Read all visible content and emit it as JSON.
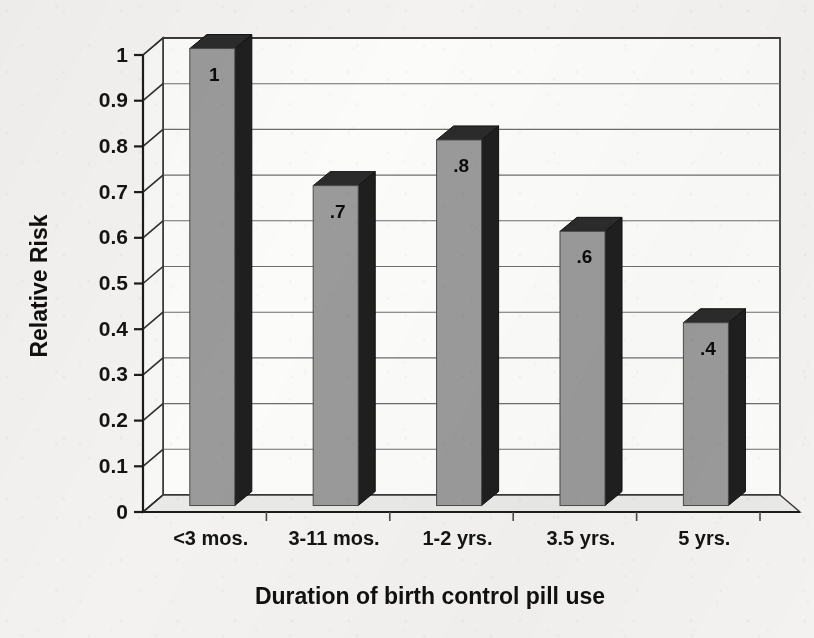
{
  "chart_data": {
    "type": "bar",
    "title": "",
    "xlabel": "Duration of birth control pill use",
    "ylabel": "Relative Risk",
    "categories": [
      "<3 mos.",
      "3-11 mos.",
      "1-2 yrs.",
      "3.5 yrs.",
      "5 yrs."
    ],
    "values": [
      1,
      0.7,
      0.8,
      0.6,
      0.4
    ],
    "data_labels": [
      "1",
      ".7",
      ".8",
      ".6",
      ".4"
    ],
    "ylim": [
      0,
      1
    ],
    "ytick_labels": [
      "0",
      "0.1",
      "0.2",
      "0.3",
      "0.4",
      "0.5",
      "0.6",
      "0.7",
      "0.8",
      "0.9",
      "1"
    ],
    "ytick_values": [
      0,
      0.1,
      0.2,
      0.3,
      0.4,
      0.5,
      0.6,
      0.7,
      0.8,
      0.9,
      1
    ],
    "grid": true,
    "legend": "none",
    "style": "3d-column",
    "colors": {
      "bar_front": "#9a9a9a",
      "bar_top": "#2b2b2b",
      "bar_side": "#1f1f1f",
      "plot_background": "#fbfbfa",
      "floor": "#3a3a3a",
      "gridline": "#6e6e6e",
      "axis": "#1c1c1c",
      "paper": "#f3f2f0",
      "text": "#121212"
    }
  }
}
